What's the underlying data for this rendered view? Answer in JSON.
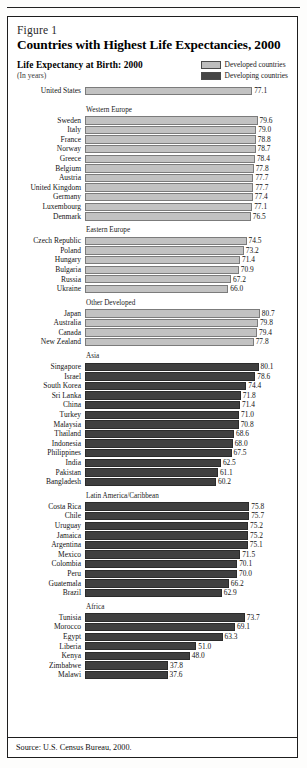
{
  "figure": {
    "number_label": "Figure 1",
    "title": "Countries with Highest Life Expectancies, 2000",
    "subhead": "Life Expectancy at Birth:  2000",
    "units": "(In years)",
    "source": "Source:  U.S. Census Bureau, 2000."
  },
  "legend": {
    "items": [
      {
        "label": "Developed countries",
        "color": "#c2c2c2",
        "key": "developed"
      },
      {
        "label": "Developing countries",
        "color": "#3f3f3f",
        "key": "developing"
      }
    ]
  },
  "chart_data": {
    "type": "bar",
    "orientation": "horizontal",
    "title": "Countries with Highest Life Expectancies, 2000",
    "subtitle": "Life Expectancy at Birth:  2000",
    "xlabel": "Life expectancy at birth (years)",
    "ylabel": "",
    "units": "years",
    "value_labels": true,
    "grid": false,
    "legend_position": "top-right",
    "xlim": [
      0,
      85
    ],
    "source": "Source:  U.S. Census Bureau, 2000.",
    "groups": [
      {
        "name": "",
        "header": "",
        "series": "developed",
        "categories": [
          "United States"
        ],
        "values": [
          77.1
        ]
      },
      {
        "name": "Western Europe",
        "header": "Western Europe",
        "series": "developed",
        "categories": [
          "Sweden",
          "Italy",
          "France",
          "Norway",
          "Greece",
          "Belgium",
          "Austria",
          "United Kingdom",
          "Germany",
          "Luxembourg",
          "Denmark"
        ],
        "values": [
          79.6,
          79.0,
          78.8,
          78.7,
          78.4,
          77.8,
          77.7,
          77.7,
          77.4,
          77.1,
          76.5
        ]
      },
      {
        "name": "Eastern Europe",
        "header": "Eastern Europe",
        "series": "developed",
        "categories": [
          "Czech Republic",
          "Poland",
          "Hungary",
          "Bulgaria",
          "Russia",
          "Ukraine"
        ],
        "values": [
          74.5,
          73.2,
          71.4,
          70.9,
          67.2,
          66.0
        ]
      },
      {
        "name": "Other Developed",
        "header": "Other Developed",
        "series": "developed",
        "categories": [
          "Japan",
          "Australia",
          "Canada",
          "New Zealand"
        ],
        "values": [
          80.7,
          79.8,
          79.4,
          77.8
        ]
      },
      {
        "name": "Asia",
        "header": "Asia",
        "series": "developing",
        "categories": [
          "Singapore",
          "Israel",
          "South Korea",
          "Sri Lanka",
          "China",
          "Turkey",
          "Malaysia",
          "Thailand",
          "Indonesia",
          "Philippines",
          "India",
          "Pakistan",
          "Bangladesh"
        ],
        "values": [
          80.1,
          78.6,
          74.4,
          71.8,
          71.4,
          71.0,
          70.8,
          68.6,
          68.0,
          67.5,
          62.5,
          61.1,
          60.2
        ]
      },
      {
        "name": "Latin America/Caribbean",
        "header": "Latin America/Caribbean",
        "series": "developing",
        "categories": [
          "Costa Rica",
          "Chile",
          "Uruguay",
          "Jamaica",
          "Argentina",
          "Mexico",
          "Colombia",
          "Peru",
          "Guatemala",
          "Brazil"
        ],
        "values": [
          75.8,
          75.7,
          75.2,
          75.2,
          75.1,
          71.5,
          70.1,
          70.0,
          66.2,
          62.9
        ]
      },
      {
        "name": "Africa",
        "header": "Africa",
        "series": "developing",
        "categories": [
          "Tunisia",
          "Morocco",
          "Egypt",
          "Liberia",
          "Kenya",
          "Zimbabwe",
          "Malawi"
        ],
        "values": [
          73.7,
          69.1,
          63.3,
          51.0,
          48.0,
          37.8,
          37.6
        ]
      }
    ]
  }
}
